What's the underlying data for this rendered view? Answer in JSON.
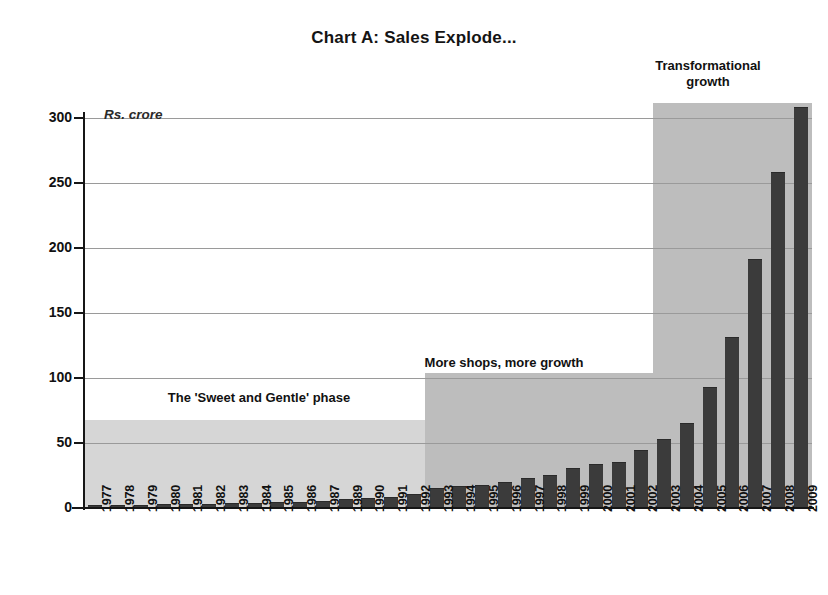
{
  "chart_data": {
    "type": "bar",
    "title": "Chart A: Sales Explode...",
    "xlabel": "",
    "ylabel": "",
    "units_note": "Rs. crore",
    "ylim": [
      0,
      300
    ],
    "yticks": [
      0,
      50,
      100,
      150,
      200,
      250,
      300
    ],
    "grid": true,
    "legend": "none",
    "bar_color": "#3b3b3b",
    "categories": [
      "1977",
      "1978",
      "1979",
      "1980",
      "1981",
      "1982",
      "1983",
      "1984",
      "1985",
      "1986",
      "1987",
      "1989",
      "1990",
      "1991",
      "1992",
      "1993",
      "1994",
      "1995",
      "1996",
      "1997",
      "1998",
      "1999",
      "2000",
      "2001",
      "2002",
      "2003",
      "2004",
      "2005",
      "2006",
      "2007",
      "2008",
      "2009"
    ],
    "values": [
      1,
      1,
      1.5,
      2,
      2,
      2.5,
      3,
      3,
      3.5,
      4,
      5,
      6,
      7,
      8,
      10,
      15,
      16,
      17,
      19,
      22,
      25,
      30,
      33,
      35,
      44,
      52,
      65,
      92,
      131,
      191,
      258,
      308
    ],
    "annotations": [
      {
        "id": "phase-1",
        "text": "The 'Sweet and Gentle' phase",
        "band_start": "1977",
        "band_end": "1992",
        "band_top_value": 68,
        "band_color": "#d6d6d6"
      },
      {
        "id": "phase-2",
        "text": "More shops, more growth",
        "band_start": "1993",
        "band_end": "2002",
        "band_top_value": 104,
        "band_color": "#bdbdbd"
      },
      {
        "id": "phase-3",
        "text": "Transformational growth",
        "text_line_1": "Transformational",
        "text_line_2": "growth",
        "band_start": "2003",
        "band_end": "2009",
        "band_top_value": 312,
        "band_color": "#bdbdbd"
      }
    ]
  }
}
